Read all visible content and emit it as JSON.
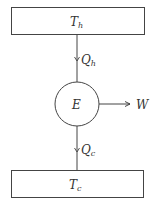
{
  "diagram": {
    "hot_reservoir": {
      "label": "T",
      "sub": "h"
    },
    "engine": {
      "label": "E"
    },
    "cold_reservoir": {
      "label": "T",
      "sub": "c"
    },
    "heat_in": {
      "label": "Q",
      "sub": "h"
    },
    "heat_out": {
      "label": "Q",
      "sub": "c"
    },
    "work": {
      "label": "W"
    }
  }
}
